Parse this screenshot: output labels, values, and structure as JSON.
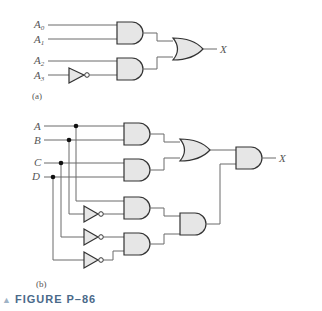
{
  "figure": {
    "caption": "FIGURE P–86",
    "marker": "▲",
    "accent_color": "#4a6a8a"
  },
  "part_a": {
    "label": "(a)",
    "inputs": [
      "A0",
      "A1",
      "A2",
      "A3"
    ],
    "input_names": {
      "a0": "A",
      "a1": "A",
      "a2": "A",
      "a3": "A"
    },
    "input_subs": {
      "a0": "0",
      "a1": "1",
      "a2": "2",
      "a3": "3"
    },
    "output": "X",
    "gates": [
      {
        "type": "AND",
        "inputs": [
          "A0",
          "A1"
        ]
      },
      {
        "type": "NOT",
        "inputs": [
          "A3"
        ]
      },
      {
        "type": "AND",
        "inputs": [
          "A2",
          "NOT A3"
        ]
      },
      {
        "type": "OR",
        "inputs": [
          "AND1",
          "AND2"
        ],
        "output": "X"
      }
    ]
  },
  "part_b": {
    "label": "(b)",
    "inputs": [
      "A",
      "B",
      "C",
      "D"
    ],
    "output": "X",
    "gates": [
      {
        "type": "AND",
        "inputs": [
          "A",
          "B"
        ]
      },
      {
        "type": "AND",
        "inputs": [
          "C",
          "D"
        ]
      },
      {
        "type": "OR",
        "inputs": [
          "AND(A,B)",
          "AND(C,D)"
        ]
      },
      {
        "type": "NOT",
        "inputs": [
          "B"
        ]
      },
      {
        "type": "NOT",
        "inputs": [
          "C"
        ]
      },
      {
        "type": "NOT",
        "inputs": [
          "D"
        ]
      },
      {
        "type": "AND",
        "inputs": [
          "A",
          "NOT B"
        ]
      },
      {
        "type": "AND",
        "inputs": [
          "NOT C",
          "NOT D"
        ]
      },
      {
        "type": "AND",
        "inputs": [
          "AND(A,B')",
          "AND(C',D')"
        ]
      },
      {
        "type": "AND",
        "inputs": [
          "OR",
          "AND"
        ],
        "output": "X"
      }
    ]
  }
}
